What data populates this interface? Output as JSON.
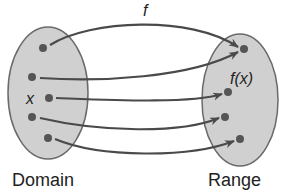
{
  "diagram": {
    "function_label": "f",
    "element_label": "x",
    "image_label": "f(x)",
    "domain_label": "Domain",
    "range_label": "Range",
    "colors": {
      "set_fill": "#d0d0d0",
      "set_stroke": "#6a6a6a",
      "dot": "#555555",
      "arrow": "#4a4a4a",
      "text": "#222222"
    },
    "domain_points": [
      [
        43,
        48
      ],
      [
        32,
        77
      ],
      [
        49,
        98
      ],
      [
        32,
        117
      ],
      [
        48,
        138
      ]
    ],
    "range_points": [
      [
        244,
        49
      ],
      [
        228,
        92
      ],
      [
        225,
        117
      ],
      [
        240,
        139
      ]
    ],
    "mappings": [
      {
        "from": 0,
        "to": 0
      },
      {
        "from": 1,
        "to": 0
      },
      {
        "from": 2,
        "to": 1
      },
      {
        "from": 3,
        "to": 2
      },
      {
        "from": 4,
        "to": 3
      }
    ]
  }
}
